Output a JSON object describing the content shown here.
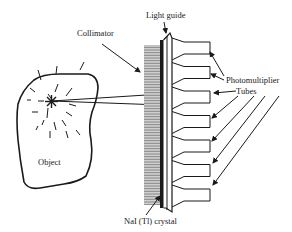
{
  "diagram": {
    "type": "gamma-camera-schematic",
    "colors": {
      "line": "#1a1a1a",
      "background": "#ffffff",
      "collimator_hatch": "#555555"
    },
    "labels": {
      "collimator": "Collimator",
      "light_guide": "Light guide",
      "photomultiplier": "Photomultiplier",
      "tubes": "Tubes",
      "object": "Object",
      "crystal": "NaI (Tl) crystal"
    },
    "components": [
      {
        "id": "object",
        "label": "Object"
      },
      {
        "id": "source",
        "label": "radioactive source (starburst)"
      },
      {
        "id": "collimator",
        "label": "Collimator"
      },
      {
        "id": "crystal",
        "label": "NaI (Tl) crystal"
      },
      {
        "id": "light_guide",
        "label": "Light guide"
      },
      {
        "id": "pmt_array",
        "label": "Photomultiplier Tubes",
        "count": 7
      }
    ],
    "connections": [
      {
        "from": "source",
        "to": "collimator",
        "kind": "gamma rays (two lines)"
      },
      {
        "from": "collimator",
        "to": "crystal"
      },
      {
        "from": "crystal",
        "to": "light_guide"
      },
      {
        "from": "light_guide",
        "to": "pmt_array"
      }
    ]
  }
}
